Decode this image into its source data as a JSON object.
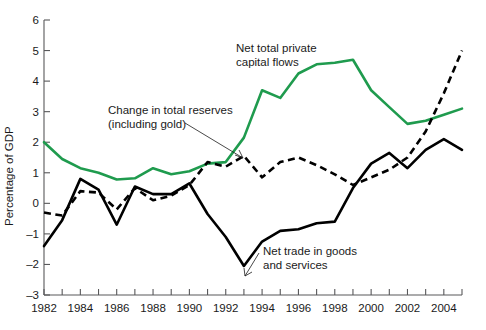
{
  "chart_data": {
    "type": "line",
    "title": "",
    "xlabel": "",
    "ylabel": "Percentage of GDP",
    "xlim": [
      1982,
      2005
    ],
    "ylim": [
      -3,
      6
    ],
    "grid": false,
    "legend_position": "inline-annotations",
    "x": [
      1982,
      1983,
      1984,
      1985,
      1986,
      1987,
      1988,
      1989,
      1990,
      1991,
      1992,
      1993,
      1994,
      1995,
      1996,
      1997,
      1998,
      1999,
      2000,
      2001,
      2002,
      2003,
      2004,
      2005
    ],
    "y_ticks": [
      -3,
      -2,
      -1,
      0,
      1,
      2,
      3,
      4,
      5,
      6
    ],
    "y_tick_labels": [
      "-3",
      "-2",
      "-1",
      "0",
      "1",
      "2",
      "3",
      "4",
      "5",
      "6"
    ],
    "x_ticks": [
      1982,
      1983,
      1984,
      1985,
      1986,
      1987,
      1988,
      1989,
      1990,
      1991,
      1992,
      1993,
      1994,
      1995,
      1996,
      1997,
      1998,
      1999,
      2000,
      2001,
      2002,
      2003,
      2004,
      2005
    ],
    "x_tick_labels": [
      "1982",
      "",
      "1984",
      "",
      "1986",
      "",
      "1988",
      "",
      "1990",
      "",
      "1992",
      "",
      "1994",
      "",
      "1996",
      "",
      "1998",
      "",
      "2000",
      "",
      "2002",
      "",
      "2004",
      ""
    ],
    "series": [
      {
        "name": "Net total private capital flows",
        "color": "#1f9b4e",
        "style": "solid",
        "values": [
          2.0,
          1.45,
          1.15,
          1.0,
          0.78,
          0.82,
          1.15,
          0.95,
          1.05,
          1.3,
          1.35,
          2.15,
          3.7,
          3.45,
          4.25,
          4.55,
          4.6,
          4.7,
          3.7,
          3.15,
          2.6,
          2.7,
          2.9,
          3.1
        ]
      },
      {
        "name": "Net trade in goods and services",
        "color": "#000000",
        "style": "solid",
        "values": [
          -1.4,
          -0.55,
          0.8,
          0.45,
          -0.7,
          0.55,
          0.3,
          0.3,
          0.65,
          -0.35,
          -1.1,
          -2.05,
          -1.25,
          -0.9,
          -0.85,
          -0.65,
          -0.6,
          0.5,
          1.3,
          1.65,
          1.15,
          1.75,
          2.1,
          1.75
        ]
      },
      {
        "name": "Change in total reserves (including gold)",
        "color": "#000000",
        "style": "dashed",
        "values": [
          -0.3,
          -0.4,
          0.4,
          0.35,
          -0.2,
          0.5,
          0.1,
          0.25,
          0.6,
          1.35,
          1.2,
          1.55,
          0.85,
          1.35,
          1.5,
          1.25,
          0.95,
          0.6,
          0.85,
          1.1,
          1.5,
          2.35,
          3.6,
          5.0
        ]
      }
    ],
    "annotations": [
      {
        "id": "ann-private-flows",
        "lines": [
          "Net total private",
          "capital flows"
        ],
        "x_px": 236,
        "y_px": 47,
        "has_leader": false
      },
      {
        "id": "ann-total-reserves",
        "lines": [
          "Change in total reserves",
          "(including gold)"
        ],
        "x_px": 108,
        "y_px": 110,
        "has_leader": true
      },
      {
        "id": "ann-net-trade",
        "lines": [
          "Net trade in goods",
          "and services"
        ],
        "x_px": 263,
        "y_px": 250,
        "has_leader": true
      }
    ]
  }
}
